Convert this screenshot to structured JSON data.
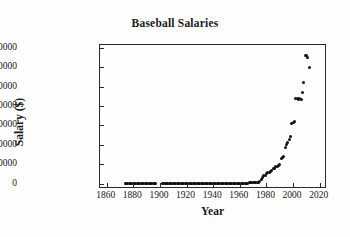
{
  "chart_data": {
    "type": "scatter",
    "title": "Baseball Salaries",
    "xlabel": "Year",
    "ylabel": "Salary ($)",
    "xlim": [
      1855,
      2024
    ],
    "ylim": [
      -900000,
      35800000
    ],
    "grid": false,
    "legend": null,
    "xticks": [
      1860,
      1880,
      1900,
      1920,
      1940,
      1960,
      1980,
      2000,
      2020
    ],
    "xtick_labels": [
      "1860",
      "1880",
      "1900",
      "1920",
      "1940",
      "1960",
      "1980",
      "2000",
      "2020"
    ],
    "yticks": [
      0,
      5000000,
      10000000,
      15000000,
      20000000,
      25000000,
      30000000,
      35000000
    ],
    "ytick_labels": [
      "0",
      "5000000",
      "10000000",
      "15000000",
      "20000000",
      "25000000",
      "30000000",
      "35000000"
    ],
    "marker": "filled-circle",
    "marker_color": "#111111",
    "series_name": "Maximum baseball salary by year",
    "x": [
      1874,
      1875,
      1876,
      1877,
      1878,
      1879,
      1880,
      1881,
      1882,
      1883,
      1884,
      1885,
      1886,
      1887,
      1888,
      1889,
      1890,
      1891,
      1892,
      1893,
      1894,
      1895,
      1896,
      1897,
      1902,
      1903,
      1904,
      1905,
      1906,
      1907,
      1908,
      1909,
      1910,
      1911,
      1912,
      1913,
      1914,
      1915,
      1916,
      1917,
      1918,
      1919,
      1920,
      1921,
      1922,
      1923,
      1924,
      1925,
      1926,
      1927,
      1928,
      1929,
      1930,
      1931,
      1932,
      1933,
      1934,
      1935,
      1936,
      1937,
      1938,
      1939,
      1940,
      1941,
      1942,
      1943,
      1944,
      1945,
      1946,
      1947,
      1948,
      1949,
      1950,
      1951,
      1952,
      1953,
      1954,
      1955,
      1956,
      1957,
      1958,
      1959,
      1960,
      1961,
      1962,
      1963,
      1964,
      1965,
      1966,
      1967,
      1968,
      1969,
      1970,
      1971,
      1972,
      1973,
      1974,
      1975,
      1976,
      1977,
      1978,
      1979,
      1980,
      1981,
      1982,
      1983,
      1984,
      1985,
      1986,
      1987,
      1988,
      1989,
      1990,
      1991,
      1992,
      1993,
      1994,
      1995,
      1996,
      1997,
      1998,
      1999,
      2000,
      2001,
      2002,
      2003,
      2004,
      2005,
      2006,
      2007,
      2008,
      2009,
      2010,
      2011,
      2012
    ],
    "y": [
      2000,
      2200,
      2400,
      2500,
      2600,
      2700,
      2800,
      3000,
      3100,
      3200,
      3400,
      3500,
      3600,
      3700,
      3800,
      4000,
      4200,
      4300,
      4400,
      4500,
      4600,
      4700,
      4800,
      5000,
      6000,
      6200,
      6400,
      6500,
      6600,
      6800,
      7000,
      9000,
      9500,
      10000,
      10500,
      11000,
      12000,
      12500,
      13000,
      14000,
      14500,
      20000,
      20000,
      30000,
      52000,
      52000,
      52000,
      52000,
      52000,
      70000,
      80000,
      80000,
      80000,
      80000,
      75000,
      52000,
      30000,
      31000,
      34000,
      35000,
      35000,
      35000,
      35000,
      40000,
      43000,
      50000,
      50000,
      55000,
      60000,
      65000,
      70000,
      80000,
      90000,
      100000,
      100000,
      100000,
      100000,
      100000,
      100000,
      100000,
      100000,
      100000,
      100000,
      110000,
      120000,
      125000,
      125000,
      130000,
      130000,
      135000,
      140000,
      150000,
      150000,
      165000,
      200000,
      250000,
      300000,
      450000,
      1000000,
      1500000,
      2000000,
      2200000,
      2500000,
      2800000,
      2900000,
      3100000,
      3400000,
      3800000,
      4000000,
      4300000,
      4500000,
      4700000,
      5000000,
      6500000,
      6600000,
      7000000,
      9200000,
      10000000,
      10500000,
      11500000,
      12200000,
      15500000,
      15700000,
      16000000,
      22000000,
      22000000,
      21600000,
      22000000,
      21700000,
      23500000,
      26000000,
      33000000,
      33000000,
      32500000,
      30000000,
      29000000,
      29000000
    ]
  }
}
